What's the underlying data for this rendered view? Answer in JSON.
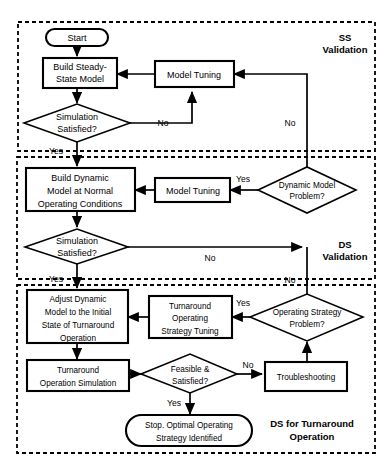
{
  "diagram": {
    "type": "flowchart",
    "groups": [
      {
        "id": "ss",
        "label_line1": "SS",
        "label_line2": "Validation",
        "label_full": "SS Validation"
      },
      {
        "id": "ds",
        "label_line1": "DS",
        "label_line2": "Validation",
        "label_full": "DS Validation"
      },
      {
        "id": "dsto",
        "label_line1": "DS for Turnaround",
        "label_line2": "Operation",
        "label_full": "DS for Turnaround Operation"
      }
    ],
    "nodes": [
      {
        "id": "start",
        "shape": "terminator",
        "lines": [
          "Start"
        ]
      },
      {
        "id": "build_ss",
        "shape": "process",
        "lines": [
          "Build Steady-",
          "State Model"
        ]
      },
      {
        "id": "tuning_ss",
        "shape": "process",
        "lines": [
          "Model Tuning"
        ]
      },
      {
        "id": "sim_sat_ss",
        "shape": "decision",
        "lines": [
          "Simulation",
          "Satisfied?"
        ]
      },
      {
        "id": "build_ds",
        "shape": "process",
        "lines": [
          "Build Dynamic",
          "Model at Normal",
          "Operating Conditions"
        ]
      },
      {
        "id": "tuning_ds",
        "shape": "process",
        "lines": [
          "Model Tuning"
        ]
      },
      {
        "id": "dyn_prob",
        "shape": "decision",
        "lines": [
          "Dynamic Model",
          "Problem?"
        ]
      },
      {
        "id": "sim_sat_ds",
        "shape": "decision",
        "lines": [
          "Simulation",
          "Satisfied?"
        ]
      },
      {
        "id": "adjust_dyn",
        "shape": "process",
        "lines": [
          "Adjust Dynamic",
          "Model to the Initial",
          "State of Turnaround",
          "Operation"
        ]
      },
      {
        "id": "ta_tuning",
        "shape": "process",
        "lines": [
          "Turnaround",
          "Operating",
          "Strategy Tuning"
        ]
      },
      {
        "id": "op_strat_prob",
        "shape": "decision",
        "lines": [
          "Operating Strategy",
          "Problem?"
        ]
      },
      {
        "id": "ta_sim",
        "shape": "process",
        "lines": [
          "Turnaround",
          "Operation Simulation"
        ]
      },
      {
        "id": "feasible",
        "shape": "decision",
        "lines": [
          "Feasible &",
          "Satisfied?"
        ]
      },
      {
        "id": "troubleshooting",
        "shape": "process",
        "lines": [
          "Troubleshooting"
        ]
      },
      {
        "id": "stop",
        "shape": "terminator",
        "lines": [
          "Stop. Optimal Operating",
          "Strategy Identified"
        ]
      }
    ],
    "edge_labels": {
      "ss_no_to_tuning": "No",
      "ss_yes": "Yes",
      "ss_return_no": "No",
      "ds_yes_to_tuning": "Yes",
      "ds_no_right": "No",
      "ds_yes_down": "Yes",
      "ds_return_no": "No",
      "strategy_yes": "Yes",
      "feasible_no": "No",
      "feasible_yes": "Yes"
    },
    "colors": {
      "stroke": "#000000",
      "fill": "#ffffff",
      "background": "#ffffff"
    }
  }
}
